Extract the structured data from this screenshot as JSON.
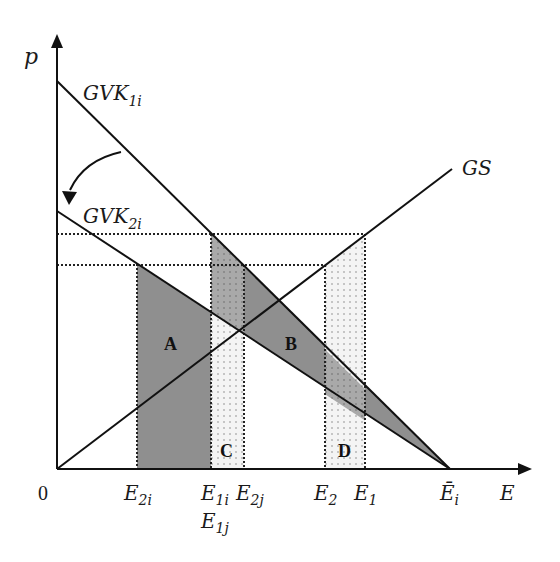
{
  "diagram": {
    "axes": {
      "y_label": "p",
      "x_label": "E",
      "origin_label": "0"
    },
    "curves": {
      "gvk1": {
        "label_main": "GVK",
        "label_sub": "1i"
      },
      "gvk2": {
        "label_main": "GVK",
        "label_sub": "2i"
      },
      "gs": {
        "label_main": "GS"
      }
    },
    "x_ticks": [
      {
        "main": "E",
        "sub": "2i"
      },
      {
        "main": "E",
        "sub": "1i"
      },
      {
        "main": "E",
        "sub": "1j"
      },
      {
        "main": "E",
        "sub": "2j"
      },
      {
        "main": "E",
        "sub": "2"
      },
      {
        "main": "E",
        "sub": "1"
      },
      {
        "main": "Ē",
        "sub": "i"
      }
    ],
    "regions": {
      "a": "A",
      "b": "B",
      "c": "C",
      "d": "D"
    },
    "colors": {
      "line": "#111111",
      "dark_fill": "#8c8c8c",
      "mid_fill": "#b0b0b0",
      "light_fill": "#f2f2f2",
      "dots": "#777777"
    }
  }
}
